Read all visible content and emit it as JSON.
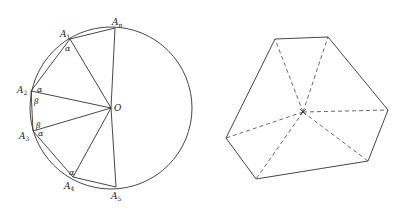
{
  "figure_left": {
    "circle": {
      "cx": 111,
      "cy": 108,
      "r": 81
    },
    "center_label": "O",
    "vertices": [
      {
        "name": "A_n",
        "base": "A",
        "sub": "n",
        "x": 115,
        "y": 28,
        "lx": 112,
        "ly": 25
      },
      {
        "name": "A_1",
        "base": "A",
        "sub": "1",
        "x": 70,
        "y": 39,
        "lx": 60,
        "ly": 37
      },
      {
        "name": "A_2",
        "base": "A",
        "sub": "2",
        "x": 31,
        "y": 91,
        "lx": 17,
        "ly": 93
      },
      {
        "name": "A_3",
        "base": "A",
        "sub": "3",
        "x": 33,
        "y": 131,
        "lx": 19,
        "ly": 139
      },
      {
        "name": "A_4",
        "base": "A",
        "sub": "4",
        "x": 73,
        "y": 177,
        "lx": 64,
        "ly": 189
      },
      {
        "name": "A_5",
        "base": "A",
        "sub": "5",
        "x": 116,
        "y": 187,
        "lx": 111,
        "ly": 199
      }
    ],
    "angle_labels": [
      {
        "text": "α",
        "x": 65,
        "y": 51
      },
      {
        "text": "α",
        "x": 37,
        "y": 92
      },
      {
        "text": "β",
        "x": 34,
        "y": 104
      },
      {
        "text": "β",
        "x": 36,
        "y": 128
      },
      {
        "text": "α",
        "x": 38,
        "y": 136
      },
      {
        "text": "α",
        "x": 69,
        "y": 175
      }
    ]
  },
  "figure_right": {
    "center": {
      "x": 303,
      "y": 112
    },
    "vertices": [
      {
        "x": 275,
        "y": 39
      },
      {
        "x": 328,
        "y": 37
      },
      {
        "x": 388,
        "y": 110
      },
      {
        "x": 368,
        "y": 161
      },
      {
        "x": 256,
        "y": 179
      },
      {
        "x": 226,
        "y": 138
      }
    ]
  },
  "colors": {
    "stroke": "#333333",
    "text": "#222222"
  }
}
